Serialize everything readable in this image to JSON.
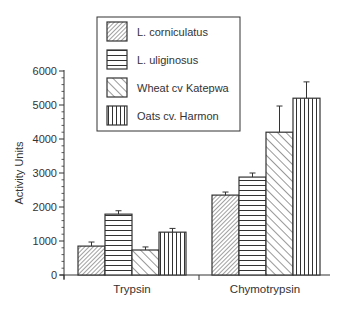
{
  "chart_data": {
    "type": "bar",
    "title": "",
    "xlabel": "",
    "ylabel": "Activity Units",
    "ylim": [
      0,
      6000
    ],
    "yticks": [
      0,
      1000,
      2000,
      3000,
      4000,
      5000,
      6000
    ],
    "grid": false,
    "legend_position": "top-center (inside box above plot)",
    "categories": [
      "Trypsin",
      "Chymotrypsin"
    ],
    "series": [
      {
        "name": "L. corniculatus",
        "pattern": "fine diagonal hatch (/)",
        "values": [
          850,
          2350
        ],
        "errors": [
          120,
          90
        ]
      },
      {
        "name": "L. uliginosus",
        "pattern": "horizontal lines",
        "values": [
          1790,
          2880
        ],
        "errors": [
          100,
          120
        ]
      },
      {
        "name": "Wheat cv Katepwa",
        "pattern": "wide diagonal hatch (\\)",
        "values": [
          735,
          4200
        ],
        "errors": [
          90,
          770
        ]
      },
      {
        "name": "Oats cv. Harmon",
        "pattern": "vertical lines",
        "values": [
          1260,
          5200
        ],
        "errors": [
          110,
          480
        ]
      }
    ]
  },
  "axis": {
    "y_title": "Activity Units",
    "y_tick_labels": [
      "0",
      "1000",
      "2000",
      "3000",
      "4000",
      "5000",
      "6000"
    ],
    "x_labels": [
      "Trypsin",
      "Chymotrypsin"
    ]
  },
  "legend": {
    "items": [
      {
        "label": "L. corniculatus"
      },
      {
        "label": "L. uliginosus"
      },
      {
        "label": "Wheat cv Katepwa"
      },
      {
        "label": "Oats cv. Harmon"
      }
    ]
  },
  "colors": {
    "ink": "#333333",
    "background": "#ffffff"
  }
}
